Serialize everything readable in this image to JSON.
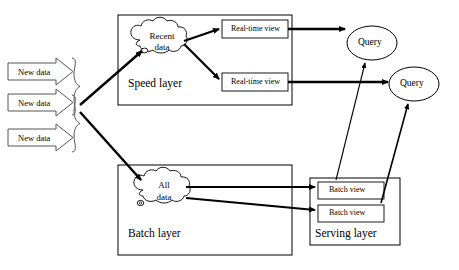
{
  "diagram": {
    "type": "architecture-flow-diagram",
    "stroke_color": "#000000",
    "fill_color": "#ffffff"
  },
  "inputs": [
    {
      "label": "New data"
    },
    {
      "label": "New data"
    },
    {
      "label": "New data"
    }
  ],
  "speed_layer": {
    "label": "Speed layer",
    "cloud": {
      "line1": "Recent",
      "line2": "data"
    },
    "views": [
      {
        "label": "Real-time view"
      },
      {
        "label": "Real-time view"
      }
    ]
  },
  "batch_layer": {
    "label": "Batch layer",
    "cloud": {
      "line1": "All",
      "line2": "data"
    }
  },
  "serving_layer": {
    "label": "Serving layer",
    "views": [
      {
        "label": "Batch view"
      },
      {
        "label": "Batch view"
      }
    ]
  },
  "queries": [
    {
      "label": "Query"
    },
    {
      "label": "Query"
    }
  ]
}
